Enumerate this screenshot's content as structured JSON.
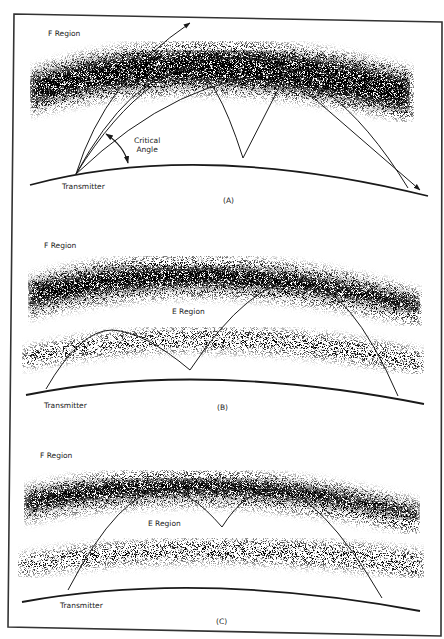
{
  "figure": {
    "panels": [
      {
        "id": "A",
        "caption": "(A)",
        "f_region_label": "F Region",
        "transmitter_label": "Transmitter",
        "critical_angle_label_line1": "Critical",
        "critical_angle_label_line2": "Angle"
      },
      {
        "id": "B",
        "caption": "(B)",
        "f_region_label": "F Region",
        "e_region_label": "E Region",
        "transmitter_label": "Transmitter"
      },
      {
        "id": "C",
        "caption": "(C)",
        "f_region_label": "F Region",
        "e_region_label": "E Region",
        "transmitter_label": "Transmitter"
      }
    ]
  },
  "colors": {
    "line": "#1a1a1a",
    "stipple": "#2a2a2a",
    "background": "#ffffff"
  }
}
